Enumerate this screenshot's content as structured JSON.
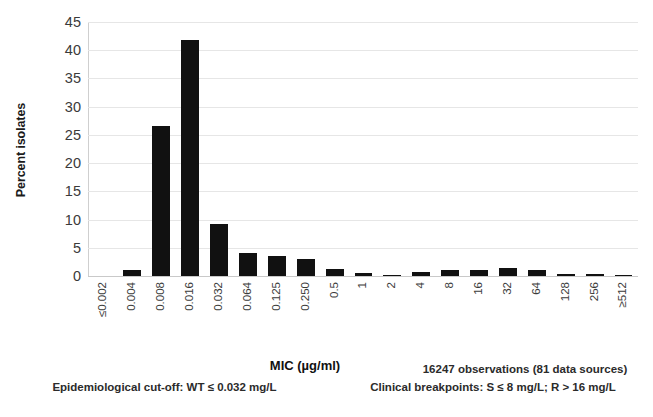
{
  "chart_data": {
    "type": "bar",
    "title": "",
    "xlabel": "MIC (µg/ml)",
    "ylabel": "Percent isolates",
    "categories": [
      "≤0.002",
      "0.004",
      "0.008",
      "0.016",
      "0.032",
      "0.064",
      "0.125",
      "0.250",
      "0.5",
      "1",
      "2",
      "4",
      "8",
      "16",
      "32",
      "64",
      "128",
      "256",
      "≥512"
    ],
    "values": [
      0,
      1.1,
      26.5,
      41.8,
      9.2,
      4.1,
      3.6,
      3.1,
      1.3,
      0.5,
      0.2,
      0.7,
      1.1,
      1.0,
      1.5,
      1.0,
      0.4,
      0.3,
      0.05
    ],
    "ylim": [
      0,
      45
    ],
    "yticks": [
      0,
      5,
      10,
      15,
      20,
      25,
      30,
      35,
      40,
      45
    ],
    "grid": true,
    "legend": false,
    "bar_color": "#111111",
    "gridline_color": "#e6e6e6",
    "axis_color": "#cfcfcf"
  },
  "annotations": {
    "observations": "16247 observations (81 data sources)",
    "ecoff": "Epidemiological cut-off:  WT ≤ 0.032 mg/L",
    "breakpoints": "Clinical breakpoints: S ≤ 8 mg/L; R > 16 mg/L"
  }
}
